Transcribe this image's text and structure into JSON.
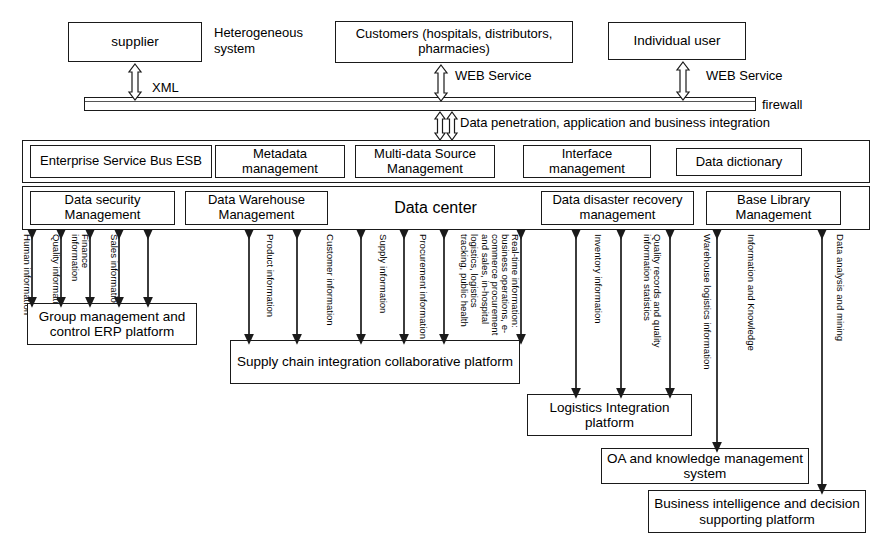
{
  "diagram": {
    "actors": [
      {
        "name": "supplier-box",
        "label": "supplier"
      },
      {
        "name": "customers-box",
        "label": "Customers (hospitals, distributors, pharmacies)"
      },
      {
        "name": "individual-user-box",
        "label": "Individual user"
      }
    ],
    "annotations": [
      {
        "name": "heterogeneous-system-label",
        "label": "Heterogeneous system"
      },
      {
        "name": "xml-label",
        "label": "XML"
      },
      {
        "name": "web-service-label-customers",
        "label": "WEB Service"
      },
      {
        "name": "web-service-label-individual",
        "label": "WEB Service"
      },
      {
        "name": "firewall-label",
        "label": "firewall"
      },
      {
        "name": "data-penetration-label",
        "label": "Data penetration, application and business integration"
      }
    ],
    "service_bus_row": [
      {
        "name": "esb-box",
        "label": "Enterprise Service Bus ESB"
      },
      {
        "name": "metadata-management-box",
        "label": "Metadata management"
      },
      {
        "name": "multi-data-source-box",
        "label": "Multi-data Source Management"
      },
      {
        "name": "interface-management-box",
        "label": "Interface management"
      },
      {
        "name": "data-dictionary-box",
        "label": "Data dictionary"
      }
    ],
    "data_center_row": [
      {
        "name": "data-security-management-box",
        "label": "Data security Management"
      },
      {
        "name": "data-warehouse-management-box",
        "label": "Data Warehouse Management"
      },
      {
        "name": "data-center-box",
        "label": "Data center"
      },
      {
        "name": "data-disaster-recovery-box",
        "label": "Data disaster recovery management"
      },
      {
        "name": "base-library-management-box",
        "label": "Base Library Management"
      }
    ],
    "flow_labels": [
      {
        "name": "flow-human-information",
        "label": "Human information"
      },
      {
        "name": "flow-quality-information",
        "label": "Quality information"
      },
      {
        "name": "flow-finance-information",
        "label": "Finance information"
      },
      {
        "name": "flow-sales-information",
        "label": "Sales information"
      },
      {
        "name": "flow-product-information",
        "label": "Product information"
      },
      {
        "name": "flow-customer-information",
        "label": "Customer information"
      },
      {
        "name": "flow-supply-information",
        "label": "Supply information"
      },
      {
        "name": "flow-procurement-information",
        "label": "Procurement information"
      },
      {
        "name": "flow-real-time-information",
        "label": "Real-time information: business operations, e-commerce procurement and sales, in-hospital logistics, logistics tracking, public health"
      },
      {
        "name": "flow-inventory-information",
        "label": "Inventory information"
      },
      {
        "name": "flow-quality-records",
        "label": "Quality records and quality information statistics"
      },
      {
        "name": "flow-warehouse-logistics-information",
        "label": "Warehouse logistics information"
      },
      {
        "name": "flow-information-and-knowledge",
        "label": "Information and Knowledge"
      },
      {
        "name": "flow-data-analysis-and-mining",
        "label": "Data analysis and mining"
      }
    ],
    "platforms": [
      {
        "name": "erp-platform-box",
        "label": "Group management and control ERP platform"
      },
      {
        "name": "supply-chain-platform-box",
        "label": "Supply chain integration collaborative platform"
      },
      {
        "name": "logistics-integration-platform-box",
        "label": "Logistics Integration platform"
      },
      {
        "name": "oa-knowledge-system-box",
        "label": "OA and knowledge management system"
      },
      {
        "name": "business-intelligence-box",
        "label": "Business intelligence and decision supporting platform"
      }
    ],
    "colors": {
      "line": "#1a1a1a",
      "background": "#ffffff",
      "text": "#000000"
    }
  }
}
